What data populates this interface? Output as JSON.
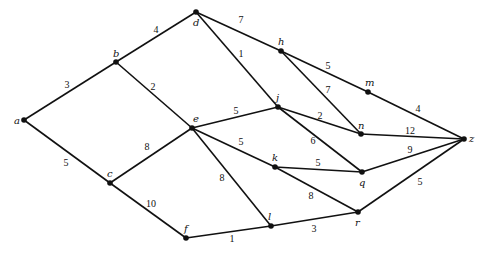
{
  "diagram": {
    "type": "weighted-undirected-graph",
    "nodes": [
      {
        "id": "a"
      },
      {
        "id": "b"
      },
      {
        "id": "c"
      },
      {
        "id": "d"
      },
      {
        "id": "e"
      },
      {
        "id": "f"
      },
      {
        "id": "h"
      },
      {
        "id": "j"
      },
      {
        "id": "k"
      },
      {
        "id": "l"
      },
      {
        "id": "m"
      },
      {
        "id": "n"
      },
      {
        "id": "q"
      },
      {
        "id": "r"
      },
      {
        "id": "z"
      }
    ],
    "edges": [
      {
        "from": "a",
        "to": "b",
        "weight": "3"
      },
      {
        "from": "b",
        "to": "d",
        "weight": "4"
      },
      {
        "from": "d",
        "to": "h",
        "weight": "7"
      },
      {
        "from": "h",
        "to": "m",
        "weight": "5"
      },
      {
        "from": "m",
        "to": "z",
        "weight": "4"
      },
      {
        "from": "b",
        "to": "e",
        "weight": "2"
      },
      {
        "from": "d",
        "to": "j",
        "weight": "1"
      },
      {
        "from": "h",
        "to": "n",
        "weight": "7"
      },
      {
        "from": "e",
        "to": "j",
        "weight": "5"
      },
      {
        "from": "j",
        "to": "n",
        "weight": "2"
      },
      {
        "from": "n",
        "to": "z",
        "weight": "12"
      },
      {
        "from": "j",
        "to": "q",
        "weight": "6"
      },
      {
        "from": "e",
        "to": "k",
        "weight": "5"
      },
      {
        "from": "k",
        "to": "q",
        "weight": "5"
      },
      {
        "from": "q",
        "to": "z",
        "weight": "9"
      },
      {
        "from": "c",
        "to": "e",
        "weight": "8"
      },
      {
        "from": "a",
        "to": "c",
        "weight": "5"
      },
      {
        "from": "c",
        "to": "f",
        "weight": "10"
      },
      {
        "from": "e",
        "to": "l",
        "weight": "8"
      },
      {
        "from": "k",
        "to": "r",
        "weight": "8"
      },
      {
        "from": "r",
        "to": "z",
        "weight": "5"
      },
      {
        "from": "f",
        "to": "l",
        "weight": "1"
      },
      {
        "from": "l",
        "to": "r",
        "weight": "3"
      }
    ]
  }
}
